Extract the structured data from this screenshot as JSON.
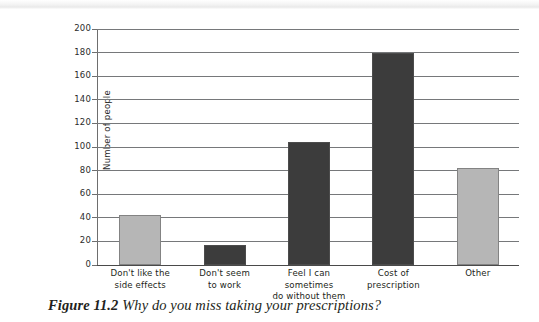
{
  "figure": {
    "caption_number": "Figure 11.2",
    "caption_text": "Why do you miss taking your prescriptions?"
  },
  "chart_data": {
    "type": "bar",
    "title": "",
    "xlabel": "",
    "ylabel": "Number of people",
    "ylim": [
      0,
      200
    ],
    "ytick_step": 20,
    "yticks": [
      "200",
      "180",
      "160",
      "140",
      "120",
      "100",
      "80",
      "60",
      "40",
      "20",
      "0"
    ],
    "grid": true,
    "legend": "none",
    "categories": [
      "Don't like the side effects",
      "Don't seem to work",
      "Feel I can sometimes do without them",
      "Cost of prescription",
      "Other"
    ],
    "category_lines": [
      [
        "Don't like the",
        "side effects"
      ],
      [
        "Don't seem",
        "to work"
      ],
      [
        "Feel I can sometimes",
        "do without them"
      ],
      [
        "Cost of",
        "prescription"
      ],
      [
        "Other"
      ]
    ],
    "values": [
      42,
      17,
      104,
      180,
      82
    ],
    "bar_colors": [
      "#b6b6b6",
      "#3c3c3c",
      "#3c3c3c",
      "#3c3c3c",
      "#b6b6b6"
    ],
    "colors": {
      "light_bar": "#b6b6b6",
      "dark_bar": "#3c3c3c",
      "gridline": "#76787a",
      "axis": "#6e6e6e",
      "text": "#231f20",
      "background": "#ffffff"
    }
  }
}
